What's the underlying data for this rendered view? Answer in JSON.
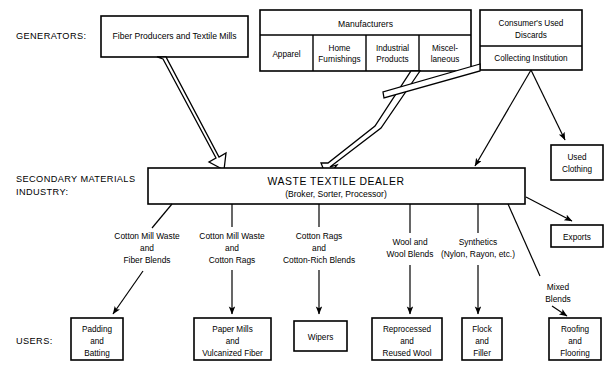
{
  "diagram": {
    "tiers": [
      {
        "id": "generators",
        "label": "GENERATORS:"
      },
      {
        "id": "secondary",
        "label_line1": "SECONDARY MATERIALS",
        "label_line2": "INDUSTRY:"
      },
      {
        "id": "users",
        "label": "USERS:"
      }
    ],
    "generators": {
      "fiber_producers": {
        "label": "Fiber Producers and Textile Mills"
      },
      "manufacturers": {
        "header": "Manufacturers",
        "columns": [
          {
            "line1": "Apparel",
            "line2": ""
          },
          {
            "line1": "Home",
            "line2": "Furnishings"
          },
          {
            "line1": "Industrial",
            "line2": "Products"
          },
          {
            "line1": "Miscel-",
            "line2": "laneous"
          }
        ]
      },
      "consumers": {
        "header_line1": "Consumer's Used",
        "header_line2": "Discards",
        "sub": "Collecting Institution"
      }
    },
    "secondary_industry": {
      "dealer_title": "WASTE TEXTILE DEALER",
      "dealer_sub": "(Broker, Sorter, Processor)"
    },
    "side_outputs": [
      {
        "id": "used-clothing",
        "line1": "Used",
        "line2": "Clothing"
      },
      {
        "id": "exports",
        "line1": "Exports",
        "line2": ""
      }
    ],
    "material_flows": [
      {
        "id": "cotton-mill-waste-fiber-blends",
        "lines": [
          "Cotton Mill Waste",
          "and",
          "Fiber Blends"
        ]
      },
      {
        "id": "cotton-mill-waste-cotton-rags",
        "lines": [
          "Cotton Mill Waste",
          "and",
          "Cotton Rags"
        ]
      },
      {
        "id": "cotton-rags-cotton-rich-blends",
        "lines": [
          "Cotton Rags",
          "and",
          "Cotton-Rich Blends"
        ]
      },
      {
        "id": "wool-and-wool-blends",
        "lines": [
          "Wool and",
          "Wool Blends"
        ]
      },
      {
        "id": "synthetics",
        "lines": [
          "Synthetics",
          "(Nylon, Rayon, etc.)"
        ]
      },
      {
        "id": "mixed-blends",
        "lines": [
          "Mixed",
          "Blends"
        ]
      }
    ],
    "users": [
      {
        "id": "padding-and-batting",
        "lines": [
          "Padding",
          "and",
          "Batting"
        ]
      },
      {
        "id": "paper-mills-and-vulcanized-fiber",
        "lines": [
          "Paper Mills",
          "and",
          "Vulcanized Fiber"
        ]
      },
      {
        "id": "wipers",
        "lines": [
          "Wipers"
        ]
      },
      {
        "id": "reprocessed-and-reused-wool",
        "lines": [
          "Reprocessed",
          "and",
          "Reused Wool"
        ]
      },
      {
        "id": "flock-and-filler",
        "lines": [
          "Flock",
          "and",
          "Filler"
        ]
      },
      {
        "id": "roofing-and-flooring",
        "lines": [
          "Roofing",
          "and",
          "Flooring"
        ]
      }
    ],
    "colors": {
      "stroke": "#000000",
      "fill": "#ffffff",
      "background": "#ffffff"
    }
  }
}
